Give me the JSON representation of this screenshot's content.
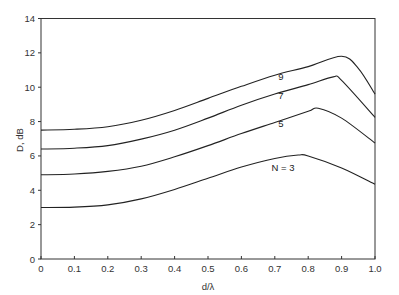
{
  "chart_data": {
    "type": "line",
    "title": "",
    "xlabel": "d/λ",
    "ylabel": "D, dB",
    "xlim": [
      0,
      1.0
    ],
    "ylim": [
      0,
      14
    ],
    "grid": false,
    "legend": "inline curve labels",
    "x_ticks": [
      "0",
      "0.1",
      "0.2",
      "0.3",
      "0.4",
      "0.5",
      "0.6",
      "0.7",
      "0.8",
      "0.9",
      "1.0"
    ],
    "y_ticks": [
      "0",
      "2",
      "4",
      "6",
      "8",
      "10",
      "12",
      "14"
    ],
    "x": [
      0,
      0.1,
      0.2,
      0.3,
      0.4,
      0.5,
      0.6,
      0.7,
      0.8,
      0.9,
      1.0
    ],
    "series": [
      {
        "name": "N = 3",
        "label": "N = 3",
        "points": [
          [
            0,
            3.0
          ],
          [
            0.1,
            3.02
          ],
          [
            0.2,
            3.15
          ],
          [
            0.3,
            3.5
          ],
          [
            0.4,
            4.05
          ],
          [
            0.5,
            4.7
          ],
          [
            0.6,
            5.35
          ],
          [
            0.7,
            5.85
          ],
          [
            0.77,
            6.05
          ],
          [
            0.8,
            6.0
          ],
          [
            0.9,
            5.3
          ],
          [
            1.0,
            4.35
          ]
        ]
      },
      {
        "name": "N = 5",
        "label": "5",
        "points": [
          [
            0,
            4.9
          ],
          [
            0.1,
            4.95
          ],
          [
            0.2,
            5.1
          ],
          [
            0.3,
            5.4
          ],
          [
            0.4,
            5.95
          ],
          [
            0.5,
            6.6
          ],
          [
            0.6,
            7.3
          ],
          [
            0.7,
            7.95
          ],
          [
            0.8,
            8.6
          ],
          [
            0.83,
            8.78
          ],
          [
            0.9,
            8.2
          ],
          [
            1.0,
            6.75
          ]
        ]
      },
      {
        "name": "N = 7",
        "label": "7",
        "points": [
          [
            0,
            6.4
          ],
          [
            0.1,
            6.45
          ],
          [
            0.2,
            6.6
          ],
          [
            0.3,
            6.98
          ],
          [
            0.4,
            7.5
          ],
          [
            0.5,
            8.2
          ],
          [
            0.6,
            8.95
          ],
          [
            0.7,
            9.6
          ],
          [
            0.8,
            10.15
          ],
          [
            0.875,
            10.6
          ],
          [
            0.9,
            10.4
          ],
          [
            1.0,
            8.25
          ]
        ]
      },
      {
        "name": "N = 9",
        "label": "9",
        "points": [
          [
            0,
            7.5
          ],
          [
            0.1,
            7.55
          ],
          [
            0.2,
            7.7
          ],
          [
            0.3,
            8.08
          ],
          [
            0.4,
            8.65
          ],
          [
            0.5,
            9.35
          ],
          [
            0.6,
            10.05
          ],
          [
            0.7,
            10.7
          ],
          [
            0.8,
            11.2
          ],
          [
            0.9,
            11.8
          ],
          [
            0.95,
            11.1
          ],
          [
            1.0,
            9.6
          ]
        ]
      }
    ],
    "annotations": [
      {
        "text": "9",
        "x": 0.71,
        "y": 10.4
      },
      {
        "text": "7",
        "x": 0.71,
        "y": 9.3
      },
      {
        "text": "5",
        "x": 0.71,
        "y": 7.7
      },
      {
        "text": "N = 3",
        "x": 0.69,
        "y": 5.1
      }
    ]
  },
  "colors": {
    "line": "#222222",
    "axis": "#333333",
    "background": "#ffffff"
  }
}
